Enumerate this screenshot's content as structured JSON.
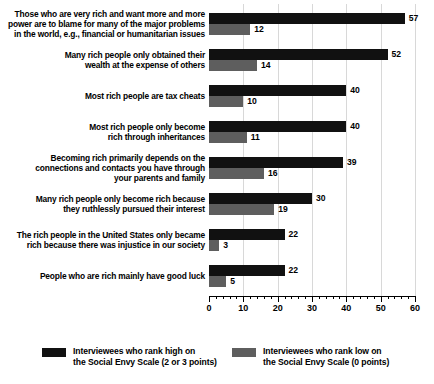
{
  "chart_data": {
    "type": "bar",
    "title": "",
    "xlabel": "",
    "ylabel": "",
    "xlim": [
      0,
      60
    ],
    "xticks": [
      0,
      10,
      20,
      30,
      40,
      50,
      60
    ],
    "xtick_labels": [
      "0",
      "10",
      "20",
      "30",
      "40",
      "50",
      "60"
    ],
    "minor_tick_step": 2,
    "grid": true,
    "grid_axis": "x",
    "orientation": "horizontal",
    "legend_position": "bottom",
    "categories": [
      "Those who are very rich and want more and more power are to blame for many of the major problems in the world, e.g., financial or humanitarian issues",
      "Many rich people only obtained their wealth at the expense of others",
      "Most rich people are tax cheats",
      "Most rich people only become rich through inheritances",
      "Becoming rich primarily depends on the connections and contacts you have through your parents and family",
      "Many rich people only become rich because they ruthlessly pursued their interest",
      "The rich people in the United States only became rich because there was injustice in our society",
      "People who are rich mainly have good luck"
    ],
    "category_lines": [
      [
        "Those who are very rich and want more and more",
        "power are to blame for many of the major problems",
        "in the world, e.g., financial or humanitarian issues"
      ],
      [
        "Many rich people only obtained their",
        "wealth at the expense of others"
      ],
      [
        "Most rich people are tax cheats"
      ],
      [
        "Most rich people only become",
        "rich through inheritances"
      ],
      [
        "Becoming rich primarily depends on the",
        "connections and contacts you have through",
        "your parents and family"
      ],
      [
        "Many rich people only become rich because",
        "they ruthlessly pursued their interest"
      ],
      [
        "The rich people in the United States only became",
        "rich because there was injustice in our society"
      ],
      [
        "People who are rich mainly have good luck"
      ]
    ],
    "series": [
      {
        "name": "Interviewees who rank high on the Social Envy Scale (2 or 3 points)",
        "color": "#111111",
        "values": [
          57,
          52,
          40,
          40,
          39,
          30,
          22,
          22
        ]
      },
      {
        "name": "Interviewees who rank low on the Social Envy Scale (0 points)",
        "color": "#5e5e5e",
        "values": [
          12,
          14,
          10,
          11,
          16,
          19,
          3,
          5
        ]
      }
    ]
  },
  "legend": {
    "items": [
      {
        "label": "Interviewees who rank high on\nthe Social Envy Scale (2 or 3 points)",
        "color": "#111111"
      },
      {
        "label": "Interviewees who rank low on\nthe Social Envy Scale (0 points)",
        "color": "#5e5e5e"
      }
    ]
  }
}
